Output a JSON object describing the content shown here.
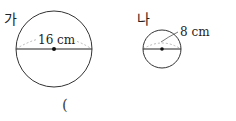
{
  "figures": [
    {
      "label": "가",
      "measure_text": "16 cm",
      "measure_type": "diameter"
    },
    {
      "label": "나",
      "measure_text": "8 cm",
      "measure_type": "radius"
    }
  ],
  "answer_blank": "("
}
